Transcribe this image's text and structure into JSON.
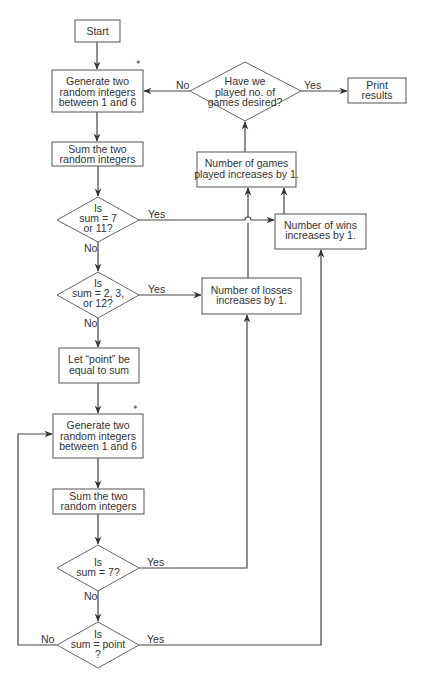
{
  "diagram": {
    "type": "flowchart",
    "nodes": {
      "start": {
        "label": "Start"
      },
      "generate1": {
        "lines": [
          "Generate two",
          "random integers",
          "between 1 and 6"
        ],
        "marker": "*"
      },
      "sum1": {
        "lines": [
          "Sum the two",
          "random integers"
        ]
      },
      "decision_7_11": {
        "lines": [
          "Is",
          "sum = 7",
          "or 11?"
        ]
      },
      "decision_2_3_12": {
        "lines": [
          "Is",
          "sum = 2, 3,",
          "or 12?"
        ]
      },
      "let_point": {
        "lines": [
          "Let “point” be",
          "equal to sum"
        ]
      },
      "generate2": {
        "lines": [
          "Generate two",
          "random integers",
          "between 1 and 6"
        ],
        "marker": "*"
      },
      "sum2": {
        "lines": [
          "Sum the two",
          "random integers"
        ]
      },
      "decision_7": {
        "lines": [
          "Is",
          "sum = 7?"
        ]
      },
      "decision_point": {
        "lines": [
          "Is",
          "sum = point",
          "?"
        ]
      },
      "losses": {
        "lines": [
          "Number of losses",
          "increases by 1."
        ]
      },
      "wins": {
        "lines": [
          "Number of wins",
          "increases by 1."
        ]
      },
      "games": {
        "lines": [
          "Number of games",
          "played increases by 1."
        ]
      },
      "decision_games": {
        "lines": [
          "Have we",
          "played no. of",
          "games desired?"
        ]
      },
      "print": {
        "lines": [
          "Print",
          "results"
        ]
      }
    },
    "edge_labels": {
      "games_no": "No",
      "games_yes": "Yes",
      "d711_yes": "Yes",
      "d711_no": "No",
      "d2312_yes": "Yes",
      "d2312_no": "No",
      "d7_yes": "Yes",
      "d7_no": "No",
      "dpoint_yes": "Yes",
      "dpoint_no": "No"
    }
  }
}
